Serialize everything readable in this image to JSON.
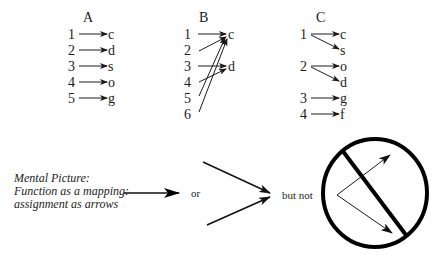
{
  "diagram": {
    "panels": [
      {
        "id": "A",
        "title": "A",
        "domain": [
          "1",
          "2",
          "3",
          "4",
          "5"
        ],
        "codomain": [
          "c",
          "d",
          "s",
          "o",
          "g"
        ],
        "mappings": [
          [
            "1",
            "c"
          ],
          [
            "2",
            "d"
          ],
          [
            "3",
            "s"
          ],
          [
            "4",
            "o"
          ],
          [
            "5",
            "g"
          ]
        ]
      },
      {
        "id": "B",
        "title": "B",
        "domain": [
          "1",
          "2",
          "3",
          "4",
          "5",
          "6"
        ],
        "codomain": [
          "c",
          "d"
        ],
        "mappings": [
          [
            "1",
            "c"
          ],
          [
            "2",
            "c"
          ],
          [
            "3",
            "d"
          ],
          [
            "4",
            "d"
          ],
          [
            "5",
            "c"
          ],
          [
            "6",
            "c"
          ]
        ]
      },
      {
        "id": "C",
        "title": "C",
        "domain": [
          "1",
          "2",
          "3",
          "4"
        ],
        "codomain": [
          "c",
          "s",
          "o",
          "d",
          "g",
          "f"
        ],
        "mappings": [
          [
            "1",
            "c"
          ],
          [
            "1",
            "s"
          ],
          [
            "2",
            "o"
          ],
          [
            "2",
            "d"
          ],
          [
            "3",
            "g"
          ],
          [
            "4",
            "f"
          ]
        ]
      }
    ],
    "caption": {
      "line1": "Mental Picture:",
      "line2": "Function as a mapping:",
      "line3": "assignment as arrows"
    },
    "connector_or": "or",
    "connector_but_not": "but not",
    "icons": {
      "single_arrow": "right-arrow-icon",
      "converging_arrows": "converging-arrows-icon",
      "prohibited_diverging_arrows": "prohibited-diverging-arrows-icon"
    },
    "colors": {
      "ink": "#1a1a1a",
      "background": "#ffffff"
    }
  }
}
